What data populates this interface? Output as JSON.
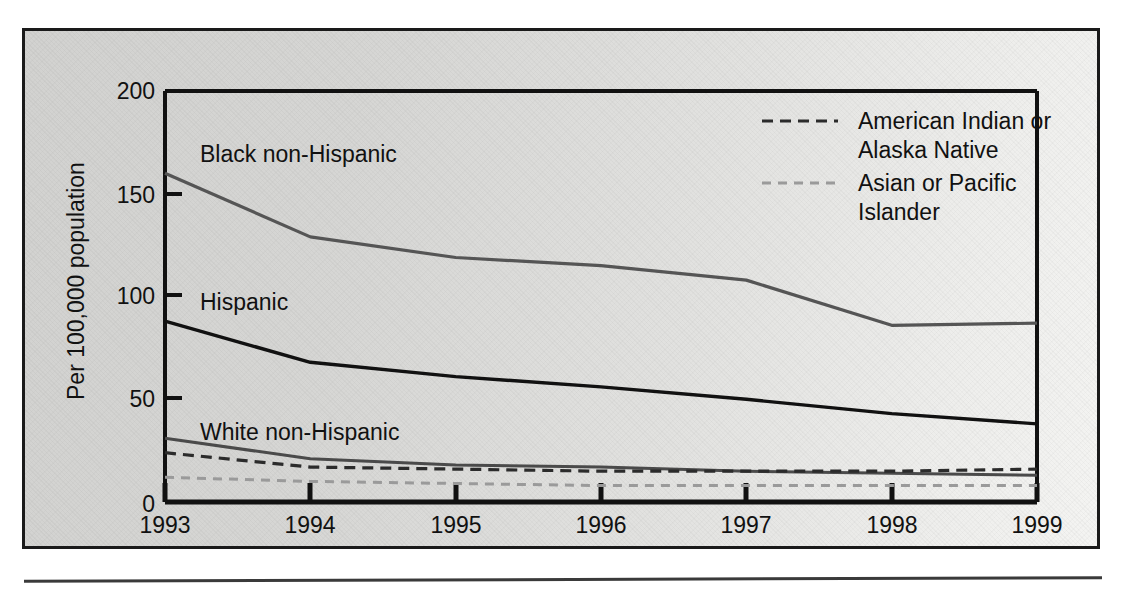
{
  "figure": {
    "background_color": "#d9d9d7",
    "frame_color": "#1a1a1a",
    "axis_color": "#111111"
  },
  "chart_data": {
    "type": "line",
    "title": "",
    "subtitle": "",
    "xlabel": "",
    "ylabel": "Per 100,000 population",
    "x": [
      "1993",
      "1994",
      "1995",
      "1996",
      "1997",
      "1998",
      "1999"
    ],
    "xlim": [
      "1993",
      "1999"
    ],
    "ylim": [
      0,
      200
    ],
    "yticks": [
      "0",
      "50",
      "100",
      "150",
      "200"
    ],
    "ytick_values": [
      0,
      50,
      100,
      150,
      200
    ],
    "grid": false,
    "legend_position": "top-right-inside",
    "series": [
      {
        "name": "Black non-Hispanic",
        "label_placement": "inline",
        "style": "solid",
        "color": "#555555",
        "width": 3.2,
        "values": [
          160,
          129,
          119,
          115,
          108,
          86,
          87
        ]
      },
      {
        "name": "Hispanic",
        "label_placement": "inline",
        "style": "solid",
        "color": "#111111",
        "width": 3.4,
        "values": [
          88,
          68,
          61,
          56,
          50,
          43,
          38
        ]
      },
      {
        "name": "White non-Hispanic",
        "label_placement": "inline",
        "style": "solid",
        "color": "#4a4a4a",
        "width": 3.0,
        "values": [
          31,
          21,
          18,
          17,
          15,
          14,
          13
        ]
      },
      {
        "name": "American Indian or Alaska Native",
        "label_placement": "legend",
        "style": "dashed",
        "color": "#2b2b2b",
        "width": 3.2,
        "dash": "11,7",
        "values": [
          24,
          17,
          16,
          15,
          15,
          15,
          16
        ]
      },
      {
        "name": "Asian or Pacific Islander",
        "label_placement": "legend",
        "style": "dotted",
        "color": "#9a9a9a",
        "width": 3.0,
        "dash": "9,7",
        "values": [
          12,
          10,
          9,
          8,
          8,
          8,
          8
        ]
      }
    ]
  },
  "inline_labels": [
    {
      "text": "Black non-Hispanic",
      "x": 200,
      "y": 162
    },
    {
      "text": "Hispanic",
      "x": 200,
      "y": 310
    },
    {
      "text": "White non-Hispanic",
      "x": 200,
      "y": 440
    }
  ],
  "legend": {
    "entries": [
      {
        "label_line1": "American Indian or",
        "label_line2": "Alaska Native",
        "swatch": "dashed-dark"
      },
      {
        "label_line1": "Asian or Pacific",
        "label_line2": "Islander",
        "swatch": "dashed-light"
      }
    ]
  }
}
